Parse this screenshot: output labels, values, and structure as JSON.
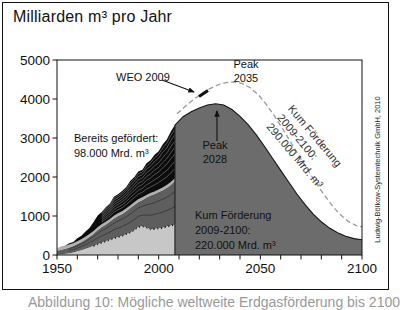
{
  "title": "Milliarden m³ pro Jahr",
  "attribution": "Ludwig-Bölkow-Systemtechnik GmbH, 2010",
  "caption_clipped": "Abbildung 10: Mögliche weltweite Erdgasförderung bis 2100",
  "annotations": {
    "weo_label": "WEO 2009",
    "peak_dashed": {
      "line1": "Peak",
      "line2": "2035"
    },
    "peak_solid": {
      "line1": "Peak",
      "line2": "2028"
    },
    "already_produced": {
      "line1": "Bereits gefördert:",
      "line2": "98.000 Mrd. m³"
    },
    "cum_solid": {
      "line1": "Kum Förderung",
      "line2": "2009-2100:",
      "line3": "220.000 Mrd. m³"
    },
    "cum_dashed": {
      "line1": "Kum Förderung",
      "line2": "2009-2100:",
      "line3": "290.000 Mrd. m³"
    }
  },
  "overlays": {
    "weo_arrow": {
      "x1": 162,
      "y1": 80,
      "x2": 194,
      "y2": 92
    },
    "weo_marker": {
      "x1": 199,
      "y1": 96.5,
      "x2": 208,
      "y2": 90.5
    },
    "peak_arrow": {
      "x1": 217,
      "y1": 141,
      "x2": 217,
      "y2": 111
    }
  },
  "chart_data": {
    "type": "area",
    "title": "Milliarden m³ pro Jahr",
    "xlabel": "",
    "ylabel": "Milliarden m³ pro Jahr",
    "xlim": [
      1950,
      2100
    ],
    "ylim": [
      0,
      5000
    ],
    "x_tick_labels": [
      1950,
      2000,
      2050,
      2100
    ],
    "x_minor_tick_step": 10,
    "y_tick_labels": [
      0,
      1000,
      2000,
      3000,
      4000,
      5000
    ],
    "grid": false,
    "legend": "none",
    "historical_stack": {
      "cumulative_label": "Bereits gefördert: 98.000 Mrd. m³",
      "years": [
        1950,
        1952,
        1954,
        1956,
        1958,
        1960,
        1962,
        1964,
        1966,
        1968,
        1970,
        1972,
        1974,
        1976,
        1978,
        1980,
        1982,
        1984,
        1986,
        1988,
        1990,
        1992,
        1994,
        1996,
        1998,
        2000,
        2002,
        2004,
        2006,
        2008
      ],
      "layers": [
        {
          "name": "light-gray-layer",
          "color": "#c7c7c7",
          "top": [
            25,
            35,
            48,
            62,
            82,
            112,
            142,
            176,
            214,
            256,
            300,
            340,
            376,
            414,
            452,
            482,
            516,
            556,
            602,
            662,
            742,
            762,
            728,
            682,
            692,
            712,
            722,
            752,
            778,
            800
          ]
        },
        {
          "name": "dark-gray-layer",
          "color": "#5e5e5e",
          "top": [
            110,
            135,
            162,
            196,
            232,
            282,
            332,
            396,
            466,
            546,
            640,
            716,
            782,
            856,
            936,
            1002,
            1052,
            1122,
            1202,
            1282,
            1362,
            1412,
            1472,
            1522,
            1562,
            1612,
            1662,
            1722,
            1802,
            1900
          ]
        },
        {
          "name": "pale-band-layer",
          "color": "#b0b0b0",
          "top_offset_above_previous": 70
        },
        {
          "name": "black-fields-layer",
          "color": "#0c0c0c",
          "top": [
            170,
            210,
            235,
            300,
            335,
            430,
            495,
            600,
            695,
            845,
            1010,
            1105,
            1225,
            1320,
            1495,
            1560,
            1640,
            1735,
            1895,
            2000,
            2140,
            2185,
            2350,
            2430,
            2570,
            2660,
            2830,
            2960,
            3170,
            3330
          ]
        }
      ]
    },
    "forecast_solid": {
      "name": "Kum Förderung 2009-2100: 220.000 Mrd. m³",
      "peak_year": 2028,
      "color": "#6c6c6c",
      "years": [
        2008,
        2012,
        2016,
        2020,
        2024,
        2028,
        2032,
        2036,
        2040,
        2044,
        2048,
        2052,
        2056,
        2060,
        2064,
        2068,
        2072,
        2076,
        2080,
        2084,
        2088,
        2092,
        2096,
        2100
      ],
      "values": [
        3330,
        3545,
        3675,
        3770,
        3845,
        3880,
        3845,
        3730,
        3555,
        3340,
        3080,
        2790,
        2480,
        2170,
        1865,
        1565,
        1290,
        1050,
        850,
        690,
        570,
        480,
        420,
        390
      ]
    },
    "forecast_dashed": {
      "name": "WEO 2009 — Kum Förderung 2009-2100: 290.000 Mrd. m³",
      "peak_year": 2035,
      "color": "#9a9a9a",
      "years": [
        2009,
        2013,
        2017,
        2021,
        2025,
        2029,
        2033,
        2037,
        2041,
        2045,
        2049,
        2053,
        2057,
        2061,
        2065,
        2069,
        2073,
        2077,
        2081,
        2085,
        2089,
        2093,
        2097,
        2100
      ],
      "values": [
        3620,
        3810,
        3980,
        4130,
        4260,
        4360,
        4420,
        4440,
        4400,
        4290,
        4110,
        3860,
        3560,
        3230,
        2890,
        2550,
        2210,
        1880,
        1570,
        1290,
        1050,
        870,
        760,
        720
      ]
    },
    "style": {
      "striation_fracs": [
        0.18,
        0.32,
        0.46,
        0.58,
        0.7,
        0.82,
        0.92
      ],
      "dark_contour_fracs": [
        0.4,
        0.75
      ],
      "dotted_offsets": [
        14,
        34
      ]
    }
  }
}
